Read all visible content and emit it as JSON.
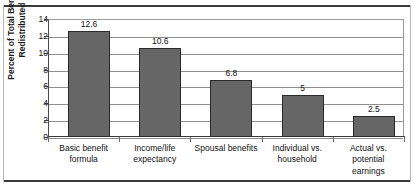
{
  "chart_data": {
    "type": "bar",
    "title": "",
    "xlabel": "",
    "ylabel": "Percent of Total Benefits Redistributed",
    "ylabel_lines": [
      "Percent of Total Benefits",
      "Redistributed"
    ],
    "categories": [
      "Basic benefit formula",
      "Income/life expectancy",
      "Spousal benefits",
      "Individual vs. household",
      "Actual vs. potential earnings"
    ],
    "category_lines": [
      [
        "Basic benefit",
        "formula"
      ],
      [
        "Income/life",
        "expectancy"
      ],
      [
        "Spousal benefits"
      ],
      [
        "Individual vs.",
        "household"
      ],
      [
        "Actual vs.",
        "potential",
        "earnings"
      ]
    ],
    "values": [
      12.6,
      10.6,
      6.8,
      5,
      2.5
    ],
    "value_labels": [
      "12.6",
      "10.6",
      "6.8",
      "5",
      "2.5"
    ],
    "ylim": [
      0,
      14
    ],
    "yticks": [
      0,
      2,
      4,
      6,
      8,
      10,
      12,
      14
    ],
    "ytick_labels": [
      "0",
      "2",
      "4",
      "6",
      "8",
      "10",
      "12",
      "14"
    ],
    "grid": true,
    "grid_axis": "y",
    "legend": false,
    "bar_color": "#666666",
    "bar_border_color": "#2a2a2a",
    "gridline_color": "#8f8f8f",
    "axis_color": "#3a3a3a",
    "background": "#ffffff"
  }
}
